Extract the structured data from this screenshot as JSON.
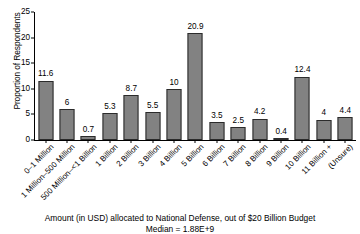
{
  "chart_data": {
    "type": "bar",
    "title": "",
    "xlabel": "Amount (in USD) allocated to National Defense, out of $20 Billion Budget",
    "xlabel_sub": "Median = 1.88E+9",
    "ylabel": "Proportion of Respondents",
    "ylim": [
      0,
      25
    ],
    "yticks": [
      0,
      5,
      10,
      15,
      20,
      25
    ],
    "grid": false,
    "legend": "none",
    "bar_color": "#828282",
    "bar_edge_color": "#2b2b2b",
    "categories": [
      "0–1 Million",
      "1 Million–500 Million",
      "500 Million–<1 Billion",
      "1 Billion",
      "2 Billion",
      "3 Billion",
      "4 Billion",
      "5 Billion",
      "6 Billion",
      "7 Billion",
      "8 Billion",
      "9 Billion",
      "10 Billion",
      "11 Billion +",
      "(Unsure)"
    ],
    "values": [
      11.6,
      6,
      0.7,
      5.3,
      8.7,
      5.5,
      10,
      20.9,
      3.5,
      2.5,
      4.2,
      0.4,
      12.4,
      4,
      4.4
    ],
    "value_labels": [
      "11.6",
      "6",
      "0.7",
      "5.3",
      "8.7",
      "5.5",
      "10",
      "20.9",
      "3.5",
      "2.5",
      "4.2",
      "0.4",
      "12.4",
      "4",
      "4.4"
    ]
  }
}
